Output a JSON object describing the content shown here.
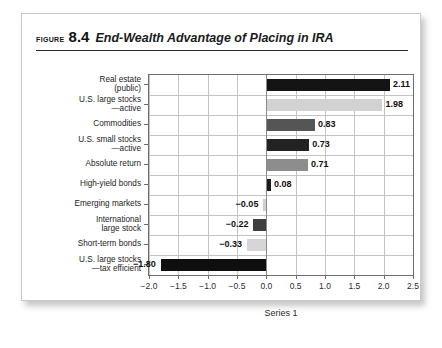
{
  "figure": {
    "label": "Figure",
    "number": "8.4",
    "caption": "End-Wealth Advantage of Placing in IRA"
  },
  "chart_data": {
    "type": "bar",
    "orientation": "horizontal",
    "title": "End-Wealth Advantage of Placing in IRA",
    "xlabel": "Series 1",
    "ylabel": "",
    "xlim": [
      -2.0,
      2.5
    ],
    "xticks": [
      "-2.0",
      "-1.5",
      "-1.0",
      "-0.5",
      "0.0",
      "0.5",
      "1.0",
      "1.5",
      "2.0",
      "2.5"
    ],
    "xtick_values": [
      -2.0,
      -1.5,
      -1.0,
      -0.5,
      0.0,
      0.5,
      1.0,
      1.5,
      2.0,
      2.5
    ],
    "grid": true,
    "legend": "Series 1",
    "categories": [
      "Real estate\n(public)",
      "U.S. large stocks\n—active",
      "Commodities",
      "U.S. small stocks\n—active",
      "Absolute return",
      "High-yield bonds",
      "Emerging markets",
      "International\nlarge stock",
      "Short-term bonds",
      "U.S. large stocks\n—tax efficient"
    ],
    "values": [
      2.11,
      1.98,
      0.83,
      0.73,
      0.71,
      0.08,
      -0.05,
      -0.22,
      -0.33,
      -1.8
    ],
    "value_labels": [
      "2.11",
      "1.98",
      "0.83",
      "0.73",
      "0.71",
      "0.08",
      "-0.05",
      "-0.22",
      "-0.33",
      "-1.80"
    ],
    "bar_colors": [
      "#141414",
      "#d2d2d2",
      "#555555",
      "#222222",
      "#8d8d8d",
      "#1a1a1a",
      "#cfcfcf",
      "#3f3f3f",
      "#d6d6d6",
      "#0f0f0f"
    ]
  }
}
